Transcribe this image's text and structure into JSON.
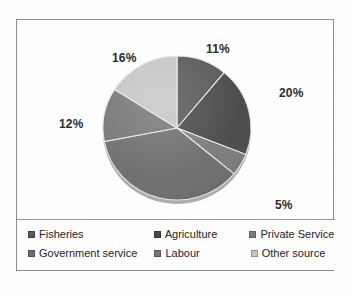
{
  "chart_data": {
    "type": "pie",
    "title": "",
    "categories": [
      "Fisheries",
      "Agriculture",
      "Private Service",
      "Government service",
      "Labour",
      "Other source"
    ],
    "values": [
      11,
      20,
      5,
      36,
      12,
      16
    ],
    "value_labels": [
      "11%",
      "20%",
      "5%",
      "36%",
      "12%",
      "16%"
    ],
    "unit": "%",
    "colors": [
      "#585858",
      "#4a4a4a",
      "#7c7c7c",
      "#6e6e6e",
      "#767676",
      "#c6c6c6"
    ],
    "legend_position": "bottom",
    "grid": false,
    "start_angle_deg": 0,
    "direction": "clockwise"
  },
  "labels": {
    "fisheries_pct": "11%",
    "agriculture_pct": "20%",
    "private_service_pct": "5%",
    "government_service_pct": "36%",
    "labour_pct": "12%",
    "other_source_pct": "16%"
  },
  "legend": {
    "rows": [
      [
        {
          "label": "Fisheries",
          "color": "#585858"
        },
        {
          "label": "Agriculture",
          "color": "#4a4a4a"
        },
        {
          "label": "Private Service",
          "color": "#7c7c7c"
        }
      ],
      [
        {
          "label": "Government service",
          "color": "#6e6e6e"
        },
        {
          "label": "Labour",
          "color": "#767676"
        },
        {
          "label": "Other source",
          "color": "#c6c6c6"
        }
      ]
    ]
  }
}
